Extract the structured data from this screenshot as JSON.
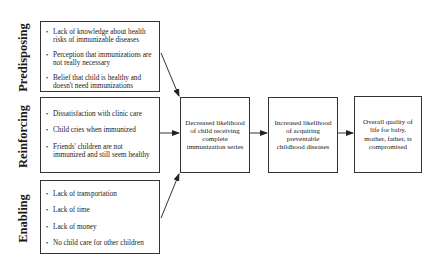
{
  "factors": [
    {
      "label": "Predisposing",
      "items": [
        "Lack of knowledge about health risks of immunizable diseases",
        "Perception that immunizations are not really necessary",
        "Belief that child is healthy and doesn't need immunizations"
      ]
    },
    {
      "label": "Reinforcing",
      "items": [
        "Dissatisfaction with clinic care",
        "Child cries when immunized",
        "Friends' children are not immunized and still seem healthy"
      ]
    },
    {
      "label": "Enabling",
      "items": [
        "Lack of transportation",
        "Lack of time",
        "Lack of money",
        "No child care for other children"
      ]
    }
  ],
  "outcomes": [
    {
      "text": "Decreased likelihood of child receiving complete immunization series"
    },
    {
      "text": "Increased likelihood of acquiring preventable childhood diseases"
    },
    {
      "text": "Overall quality of life for baby, mother, father, is compromised"
    }
  ],
  "colors": {
    "line": "#333333",
    "background": "#ffffff"
  }
}
